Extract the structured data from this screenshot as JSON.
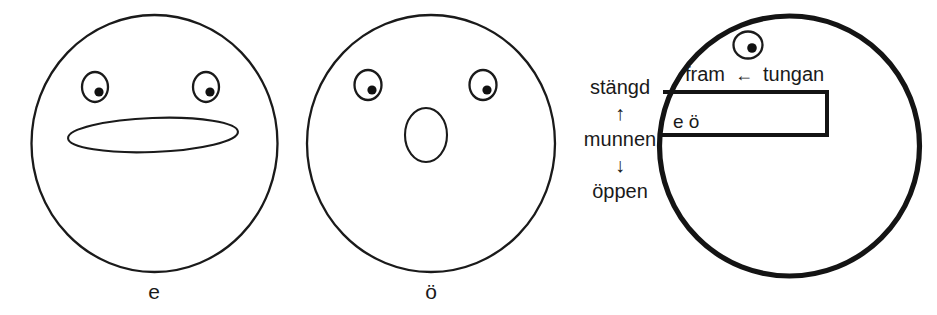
{
  "figure": {
    "language": "sv"
  },
  "panels": [
    {
      "id": "face-e",
      "caption": "e",
      "mouth_shape": "wide-flat-ellipse",
      "eye_count": 2
    },
    {
      "id": "face-oe",
      "caption": "ö",
      "mouth_shape": "small-vertical-oval",
      "eye_count": 2
    },
    {
      "id": "vowel-chart",
      "caption": "",
      "eye_count": 1
    }
  ],
  "chart": {
    "vertical_axis": {
      "top_label": "stängd",
      "top_arrow": "↑",
      "axis_name": "munnen",
      "bottom_arrow": "↓",
      "bottom_label": "öppen"
    },
    "horizontal_axis": {
      "front_label": "fram",
      "arrow": "←",
      "axis_name": "tungan"
    },
    "box_vowels": "e ö"
  }
}
